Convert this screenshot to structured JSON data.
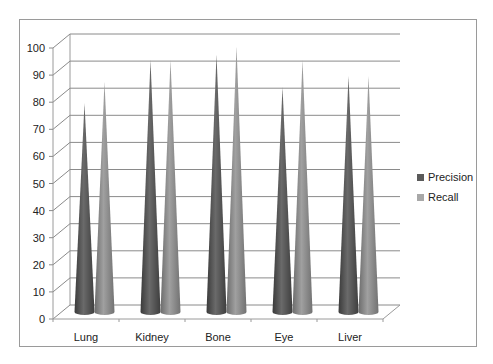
{
  "chart_data": {
    "type": "bar",
    "subtype": "3d-cone",
    "title": "",
    "xlabel": "",
    "ylabel": "",
    "categories": [
      "Lung",
      "Kidney",
      "Bone",
      "Eye",
      "Liver"
    ],
    "series": [
      {
        "name": "Precision",
        "color": "#5a5a5a",
        "values": [
          77,
          93,
          95,
          83,
          87
        ]
      },
      {
        "name": "Recall",
        "color": "#8c8c8c",
        "values": [
          85,
          93,
          98,
          93,
          87
        ]
      }
    ],
    "ylim": [
      0,
      100
    ],
    "yticks": [
      0,
      10,
      20,
      30,
      40,
      50,
      60,
      70,
      80,
      90,
      100
    ],
    "grid": true,
    "legend_position": "right"
  },
  "legend": {
    "items": [
      {
        "label": "Precision",
        "color": "#5a5a5a"
      },
      {
        "label": "Recall",
        "color": "#8c8c8c"
      }
    ]
  }
}
